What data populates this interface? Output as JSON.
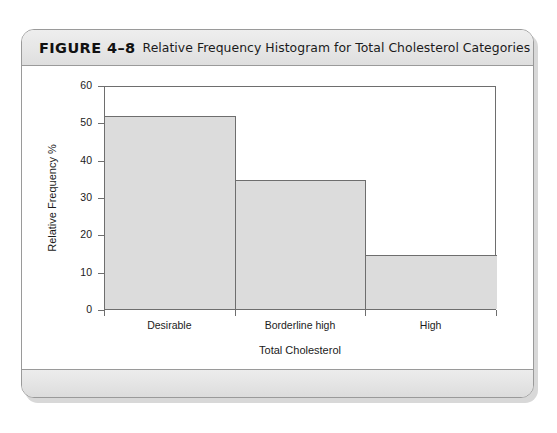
{
  "figure": {
    "number": "FIGURE 4–8",
    "caption": "Relative Frequency Histogram for Total Cholesterol Categories"
  },
  "chart_data": {
    "type": "bar",
    "title": "Relative Frequency Histogram for Total Cholesterol Categories",
    "categories": [
      "Desirable",
      "Borderline high",
      "High"
    ],
    "values": [
      51.6,
      34.5,
      14.4
    ],
    "xlabel": "Total Cholesterol",
    "ylabel": "Relative Frequency %",
    "ylim": [
      0,
      60
    ],
    "yticks": [
      0,
      10,
      20,
      30,
      40,
      50,
      60
    ],
    "ytick_labels": [
      "0",
      "10",
      "20",
      "30",
      "40",
      "50",
      "60"
    ],
    "grid": false,
    "legend": null,
    "bar_fill_color": "#dcdcdc",
    "bar_edge_color": "#6e6e6e",
    "bar_gap": 0
  },
  "colors": {
    "card_border": "#9a9a9a",
    "header_band": "#e6e6e6",
    "footer_band": "#e3e3e3",
    "axis": "#6e6e6e",
    "text": "#1b1b1b"
  }
}
